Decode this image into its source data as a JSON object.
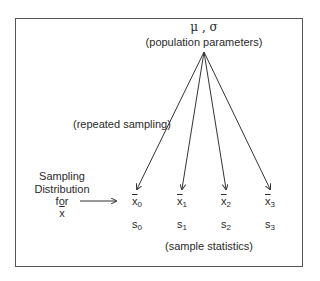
{
  "diagram": {
    "population": {
      "symbols": "μ , σ",
      "label": "(population parameters)"
    },
    "edge_label": "(repeated sampling)",
    "sampling_distribution": {
      "lines": [
        "Sampling",
        "Distribution",
        "for",
        "x"
      ],
      "last_line_overbar": true
    },
    "samples": [
      {
        "mean_symbol": "x",
        "mean_sub": "0",
        "sd_symbol": "s",
        "sd_sub": "0"
      },
      {
        "mean_symbol": "x",
        "mean_sub": "1",
        "sd_symbol": "s",
        "sd_sub": "1"
      },
      {
        "mean_symbol": "x",
        "mean_sub": "2",
        "sd_symbol": "s",
        "sd_sub": "2"
      },
      {
        "mean_symbol": "x",
        "mean_sub": "3",
        "sd_symbol": "s",
        "sd_sub": "3"
      }
    ],
    "statistics_label": "(sample statistics)",
    "colors": {
      "line": "#333333",
      "text": "#2a2a2a",
      "border": "#555555"
    }
  }
}
